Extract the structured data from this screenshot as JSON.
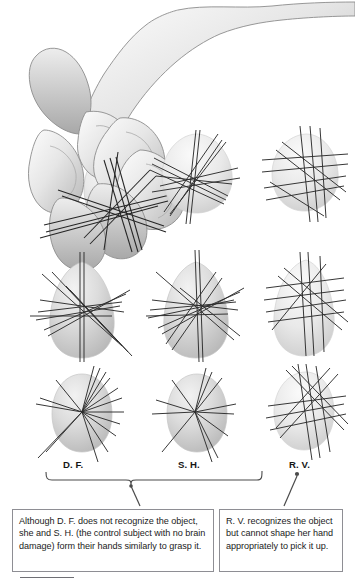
{
  "figure": {
    "title_text": "",
    "background_color": "#ffffff",
    "ink_color": "#2b2b2b",
    "object_fill_color": "#cfcfcf",
    "box_border_color": "#8e8e94"
  },
  "hand_illustration": {
    "name": "hand-grasping-object",
    "description": "Grayscale line drawing of a right hand and forearm reaching down, thumb and fingers closing in a precision grip around a pale egg-shaped object",
    "shading_color": "#bfbfbf",
    "outline_color": "#6e6e6e"
  },
  "columns": [
    {
      "key": "df",
      "label": "D. F.",
      "center_x": 80
    },
    {
      "key": "sh",
      "label": "S. H.",
      "center_x": 195
    },
    {
      "key": "rv",
      "label": "R. V.",
      "center_x": 305
    }
  ],
  "rows": [
    {
      "key": "row1",
      "object_shape": "egg-tilted",
      "center_y": 182
    },
    {
      "key": "row2",
      "object_shape": "egg-upright",
      "center_y": 302
    },
    {
      "key": "row3",
      "object_shape": "oval-round",
      "center_y": 412
    }
  ],
  "grasp_panels": [
    {
      "column": "df",
      "row": "row1",
      "pattern": "converging",
      "line_count": 12
    },
    {
      "column": "sh",
      "row": "row1",
      "pattern": "converging",
      "line_count": 11
    },
    {
      "column": "rv",
      "row": "row1",
      "pattern": "scattered-grid",
      "line_count": 10
    },
    {
      "column": "df",
      "row": "row2",
      "pattern": "converging",
      "line_count": 12
    },
    {
      "column": "sh",
      "row": "row2",
      "pattern": "converging",
      "line_count": 12
    },
    {
      "column": "rv",
      "row": "row2",
      "pattern": "scattered-grid",
      "line_count": 10
    },
    {
      "column": "df",
      "row": "row3",
      "pattern": "radial-fan",
      "line_count": 14
    },
    {
      "column": "sh",
      "row": "row3",
      "pattern": "radial-fan",
      "line_count": 11
    },
    {
      "column": "rv",
      "row": "row3",
      "pattern": "scattered-grid",
      "line_count": 10
    }
  ],
  "bracket": {
    "name": "df-sh-group-bracket",
    "spans_columns": [
      "D. F.",
      "S. H."
    ],
    "pointer_to": "caption-left"
  },
  "rv_pointer": {
    "name": "rv-pointer",
    "from_label": "R. V.",
    "pointer_to": "caption-right"
  },
  "captions": {
    "left": "Although D. F. does not recognize the object, she and S. H. (the control subject with no brain damage) form their hands similarly to grasp it.",
    "right": "R. V. recognizes the object but cannot shape her hand appropriately to pick it up."
  }
}
